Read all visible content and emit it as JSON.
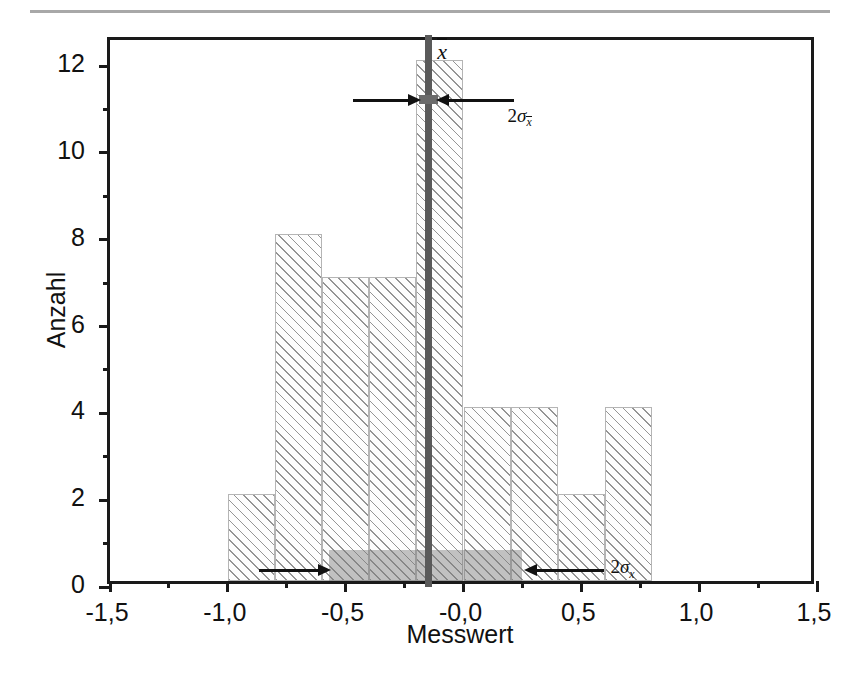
{
  "chart_data": {
    "type": "bar",
    "title": "",
    "xlabel": "Messwert",
    "ylabel": "Anzahl",
    "xlim": [
      -1.5,
      1.5
    ],
    "ylim": [
      0,
      12.6
    ],
    "grid": false,
    "legend": null,
    "bin_width": 0.2,
    "categories": [
      "-1.0",
      "-0.8",
      "-0.6",
      "-0.4",
      "-0.2",
      "0.0",
      "0.2",
      "0.4",
      "0.6"
    ],
    "bin_starts": [
      -1.0,
      -0.8,
      -0.6,
      -0.4,
      -0.2,
      0.0,
      0.2,
      0.4,
      0.6
    ],
    "values": [
      2,
      8,
      7,
      7,
      12,
      4,
      4,
      2,
      4
    ],
    "x_ticks": [
      -1.5,
      -1.0,
      -0.5,
      0.0,
      0.5,
      1.0,
      1.5
    ],
    "x_tick_labels": [
      "-1,5",
      "-1,0",
      "-0,5",
      "-0,0",
      "0,5",
      "1,0",
      "1,5"
    ],
    "y_ticks": [
      0,
      2,
      4,
      6,
      8,
      10,
      12
    ],
    "y_tick_labels": [
      "0",
      "2",
      "4",
      "6",
      "8",
      "10",
      "12"
    ],
    "y_minor_ticks": [
      1,
      3,
      5,
      7,
      9,
      11
    ],
    "x_minor_ticks": [
      -1.25,
      -0.75,
      -0.25,
      0.25,
      0.75,
      1.25
    ],
    "annotations": {
      "mean_value": -0.15,
      "mean_label": "x",
      "sigma_mean_label_prefix": "2",
      "sigma_mean_label_sigma": "σ",
      "sigma_mean_label_sub": "x",
      "sigma_x_label_prefix": "2",
      "sigma_x_label_sigma": "σ",
      "sigma_x_label_sub": "x",
      "sigma_x_band_from": -0.57,
      "sigma_x_band_to": 0.25,
      "sigma_mean_from": -0.19,
      "sigma_mean_to": -0.11,
      "sigma_mean_height": 11.25,
      "sigma_x_band_height": 0.72
    }
  },
  "colors": {
    "frame": "#1a1a1a",
    "bar_edge": "#b5b5b5",
    "bar_hatch": "#828282",
    "mean_line": "#5a5a5a",
    "sigma_band": "rgba(120,120,120,0.45)",
    "top_rule": "#a8a8a8",
    "text": "#111111"
  }
}
